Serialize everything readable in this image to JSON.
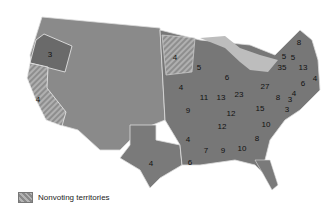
{
  "legend": {
    "label": "Nonvoting territories"
  },
  "colors": {
    "state": "#7a7a7a",
    "territory": "#9a9a9a",
    "water": "#c8c8c8",
    "border": "#e8e8e8"
  },
  "states": [
    {
      "name": "Oregon",
      "value": "3",
      "x": 50,
      "y": 55
    },
    {
      "name": "California",
      "value": "4",
      "x": 38,
      "y": 100
    },
    {
      "name": "Texas",
      "value": "4",
      "x": 151,
      "y": 164
    },
    {
      "name": "Minnesota",
      "value": "4",
      "x": 175,
      "y": 58
    },
    {
      "name": "Iowa",
      "value": "4",
      "x": 181,
      "y": 88
    },
    {
      "name": "Wisconsin",
      "value": "5",
      "x": 199,
      "y": 68
    },
    {
      "name": "Michigan",
      "value": "6",
      "x": 227,
      "y": 78
    },
    {
      "name": "Missouri",
      "value": "9",
      "x": 188,
      "y": 111
    },
    {
      "name": "Arkansas",
      "value": "4",
      "x": 188,
      "y": 140
    },
    {
      "name": "Louisiana",
      "value": "6",
      "x": 190,
      "y": 163
    },
    {
      "name": "Illinois",
      "value": "11",
      "x": 204,
      "y": 98
    },
    {
      "name": "Indiana",
      "value": "13",
      "x": 221,
      "y": 98
    },
    {
      "name": "Ohio",
      "value": "23",
      "x": 239,
      "y": 95
    },
    {
      "name": "Kentucky",
      "value": "12",
      "x": 231,
      "y": 114
    },
    {
      "name": "Tennessee",
      "value": "12",
      "x": 222,
      "y": 127
    },
    {
      "name": "Mississippi",
      "value": "7",
      "x": 206,
      "y": 151
    },
    {
      "name": "Alabama",
      "value": "9",
      "x": 223,
      "y": 151
    },
    {
      "name": "Georgia",
      "value": "10",
      "x": 242,
      "y": 149
    },
    {
      "name": "South Carolina",
      "value": "8",
      "x": 257,
      "y": 139
    },
    {
      "name": "North Carolina",
      "value": "10",
      "x": 266,
      "y": 125
    },
    {
      "name": "Virginia",
      "value": "15",
      "x": 260,
      "y": 109
    },
    {
      "name": "Pennsylvania",
      "value": "27",
      "x": 265,
      "y": 87
    },
    {
      "name": "Maryland",
      "value": "8",
      "x": 278,
      "y": 98
    },
    {
      "name": "New York",
      "value": "35",
      "x": 282,
      "y": 68
    },
    {
      "name": "Vermont",
      "value": "5",
      "x": 284,
      "y": 57
    },
    {
      "name": "New Hampshire",
      "value": "5",
      "x": 293,
      "y": 58
    },
    {
      "name": "Maine",
      "value": "8",
      "x": 299,
      "y": 43
    },
    {
      "name": "Massachusetts",
      "value": "13",
      "x": 303,
      "y": 68
    },
    {
      "name": "Rhode Island",
      "value": "4",
      "x": 315,
      "y": 79
    },
    {
      "name": "Connecticut",
      "value": "6",
      "x": 303,
      "y": 84
    },
    {
      "name": "New Jersey",
      "value": "4",
      "x": 294,
      "y": 94
    },
    {
      "name": "Delaware",
      "value": "3",
      "x": 290,
      "y": 100
    },
    {
      "name": "Maryland-east",
      "value": "3",
      "x": 287,
      "y": 110
    }
  ]
}
